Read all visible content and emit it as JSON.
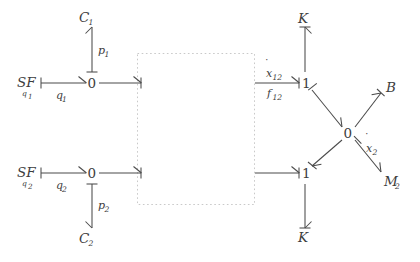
{
  "diagram": {
    "type": "bond-graph",
    "title": "",
    "background_color": "#ffffff",
    "line_color": "#4a4a4a",
    "dotted_box_color": "#c9c9c9",
    "nodes": {
      "sf1": {
        "label": "SF",
        "subscript": "q",
        "sub_index": "1"
      },
      "sf2": {
        "label": "SF",
        "subscript": "q",
        "sub_index": "2"
      },
      "zero_top_left": {
        "label": "0"
      },
      "zero_bottom_left": {
        "label": "0"
      },
      "one_top_right": {
        "label": "1"
      },
      "one_bottom_right": {
        "label": "1"
      },
      "zero_right": {
        "label": "0"
      },
      "c1": {
        "label": "C",
        "sub": "1"
      },
      "c2": {
        "label": "C",
        "sub": "2"
      },
      "k_top": {
        "label": "K"
      },
      "k_bottom": {
        "label": "K"
      },
      "b": {
        "label": "B"
      },
      "m2": {
        "label": "M",
        "sub": "2"
      }
    },
    "bond_labels": {
      "q1": {
        "base": "q",
        "sub": "1"
      },
      "q2": {
        "base": "q",
        "sub": "2"
      },
      "p1": {
        "base": "p",
        "sub": "1"
      },
      "p2": {
        "base": "p",
        "sub": "2"
      },
      "xdot12": {
        "base": "x",
        "sub": "12",
        "accent": "dot"
      },
      "f12": {
        "base": "f",
        "sub": "12"
      },
      "xdot2": {
        "base": "x",
        "sub": "2",
        "accent": "dot"
      }
    },
    "dotted_box": {
      "x": 137,
      "y": 53,
      "width": 118,
      "height": 152
    }
  }
}
